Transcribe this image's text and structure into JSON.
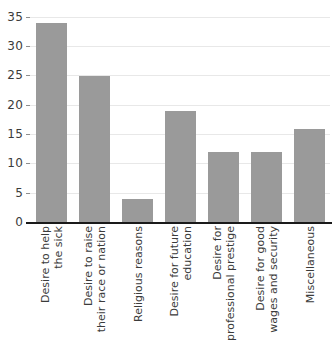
{
  "chart_data": {
    "type": "bar",
    "title": "",
    "subtitle": "",
    "xlabel": "",
    "ylabel": "",
    "categories": [
      "Desire to help the sick",
      "Desire to raise their race or nation",
      "Religious reasons",
      "Desire for future education",
      "Desire for professional prestige",
      "Desire for good wages and security",
      "Miscellaneous"
    ],
    "category_lines": [
      [
        "Desire to help",
        "the sick"
      ],
      [
        "Desire to raise",
        "their race or nation"
      ],
      [
        "Religious reasons"
      ],
      [
        "Desire for future",
        "education"
      ],
      [
        "Desire for",
        "professional prestige"
      ],
      [
        "Desire for good",
        "wages and security"
      ],
      [
        "Miscellaneous"
      ]
    ],
    "values": [
      34,
      25,
      4,
      19,
      12,
      12,
      16
    ],
    "ylim": [
      0,
      35
    ],
    "yticks": [
      0,
      5,
      10,
      15,
      20,
      25,
      30,
      35
    ],
    "ytick_labels": [
      "0",
      "5",
      "10",
      "15",
      "20",
      "25",
      "30",
      "35"
    ],
    "grid": true,
    "legend": false,
    "bar_color": "#9a9a9a",
    "gridline_color": "#e8e8e8",
    "axis_color": "#1a1a1a",
    "text_color": "#3b3b3b",
    "background": "#ffffff"
  }
}
